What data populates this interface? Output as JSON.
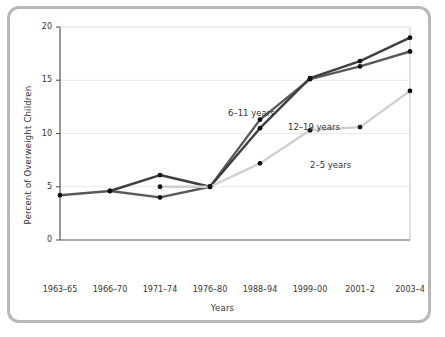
{
  "chart_data": {
    "type": "line",
    "title": "",
    "subtitle": "",
    "xlabel": "Years",
    "ylabel": "Percent of Overweight Children",
    "categories": [
      "1963–65",
      "1966–70",
      "1971–74",
      "1976–80",
      "1988–94",
      "1999–00",
      "2001–2",
      "2003–4"
    ],
    "ylim": [
      0,
      20
    ],
    "yticks": [
      0,
      5,
      10,
      15,
      20
    ],
    "ytick_labels": [
      "0",
      "5",
      "10",
      "15",
      "20"
    ],
    "grid": true,
    "grid_axis": "y",
    "legend": "inline-annotations",
    "series": [
      {
        "name": "6–11 years",
        "color": "#5a5a5a",
        "values": [
          4.2,
          4.6,
          4.0,
          5.0,
          11.3,
          15.1,
          16.3,
          17.7
        ]
      },
      {
        "name": "12–19 years",
        "color": "#3f3f3f",
        "values": [
          null,
          4.6,
          6.1,
          5.0,
          10.5,
          15.2,
          16.8,
          19.0
        ]
      },
      {
        "name": "2–5 years",
        "color": "#cfcfcf",
        "values": [
          null,
          null,
          5.0,
          5.0,
          7.2,
          10.3,
          10.6,
          14.0
        ]
      }
    ],
    "annotations": [
      {
        "text": "6–11 years",
        "x_px": 228,
        "y_px": 108
      },
      {
        "text": "12–19 years",
        "x_px": 288,
        "y_px": 122
      },
      {
        "text": "2–5 years",
        "x_px": 310,
        "y_px": 160
      }
    ]
  },
  "colors": {
    "frame_border": "#b8b8b8",
    "plot_border": "#bfbfbf",
    "gridline": "#e8e8e8",
    "axis": "#555555",
    "text": "#333333",
    "series_6_11": "#5a5a5a",
    "series_12_19": "#3f3f3f",
    "series_2_5": "#cfcfcf",
    "marker": "#111111",
    "background": "#ffffff"
  }
}
